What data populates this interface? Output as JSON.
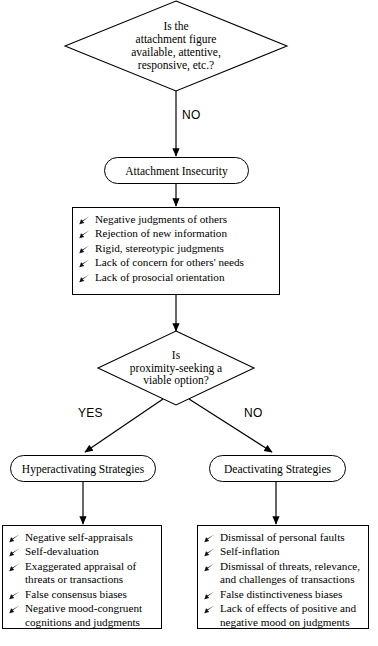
{
  "diagram": {
    "stroke_color": "#000000",
    "background_color": "#ffffff",
    "bullet_icon": "pen-nib-bullet"
  },
  "nodes": {
    "decision_1": {
      "shape": "diamond",
      "lines": [
        "Is the",
        "attachment figure",
        "available, attentive,",
        "responsive, etc.?"
      ]
    },
    "insecurity": {
      "shape": "stadium",
      "label": "Attachment Insecurity"
    },
    "outcomes": {
      "shape": "rectangle",
      "items": [
        "Negative judgments of others",
        "Rejection of new information",
        "Rigid, stereotypic judgments",
        "Lack of concern for others' needs",
        "Lack of prosocial orientation"
      ]
    },
    "decision_2": {
      "shape": "diamond",
      "lines": [
        "Is",
        "proximity-seeking a",
        "viable option?"
      ]
    },
    "hyperactivating": {
      "shape": "stadium",
      "label": "Hyperactivating Strategies"
    },
    "deactivating": {
      "shape": "stadium",
      "label": "Deactivating Strategies"
    },
    "hyperactivating_outcomes": {
      "shape": "rectangle",
      "items": [
        "Negative self-appraisals",
        "Self-devaluation",
        "Exaggerated appraisal of threats or transactions",
        "False consensus biases",
        "Negative mood-congruent cognitions and judgments"
      ]
    },
    "deactivating_outcomes": {
      "shape": "rectangle",
      "items": [
        "Dismissal of personal faults",
        "Self-inflation",
        "Dismissal of threats, relevance, and challenges of transactions",
        "False distinctiveness biases",
        "Lack of effects of positive and negative mood on judgments"
      ]
    }
  },
  "edge_labels": {
    "no_top": "NO",
    "yes_branch": "YES",
    "no_branch": "NO"
  }
}
